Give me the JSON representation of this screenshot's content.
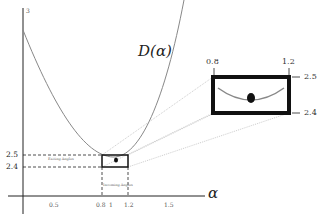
{
  "figure": {
    "curve_label": "D(α)",
    "x_axis_label": "α",
    "y_axis_top_tick": "3",
    "x_ticks": [
      "0.5",
      "0.8",
      "1",
      "1.2",
      "1.5"
    ],
    "y_ticks": [
      "2.5",
      "2.4"
    ],
    "exiting_label": "Exiting Angles",
    "incoming_label": "Incoming Angles",
    "inset": {
      "x_left": "0.8",
      "x_right": "1.2",
      "y_top": "2.5",
      "y_bottom": "2.4"
    },
    "colors": {
      "axes": "#222222",
      "curve": "#888888",
      "box": "#111111",
      "guides": "#999999"
    }
  }
}
